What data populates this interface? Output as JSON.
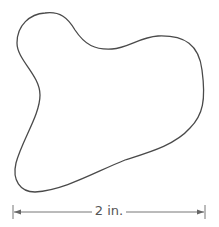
{
  "figure": {
    "shape": {
      "description": "irregular closed blob outline",
      "stroke_color": "#4a4a4a",
      "fill_color": "#ffffff"
    },
    "dimension": {
      "label": "2 in.",
      "line_color": "#666666"
    }
  }
}
